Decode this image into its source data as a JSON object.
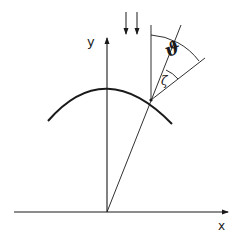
{
  "diagram": {
    "type": "geometry",
    "axes": {
      "x_label": "x",
      "y_label": "y"
    },
    "angles": {
      "theta": "ϑ",
      "zeta": "ζ"
    },
    "colors": {
      "stroke": "#1a1a1a",
      "background": "#ffffff"
    }
  }
}
